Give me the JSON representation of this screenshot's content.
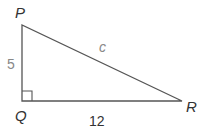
{
  "diagram": {
    "type": "right-triangle",
    "vertices": {
      "P": {
        "label": "P"
      },
      "Q": {
        "label": "Q"
      },
      "R": {
        "label": "R"
      }
    },
    "sides": {
      "PQ": {
        "label": "5"
      },
      "QR": {
        "label": "12"
      },
      "PR": {
        "label": "c"
      }
    },
    "right_angle_at": "Q",
    "colors": {
      "line": "#555555",
      "label": "#333333",
      "side_label": "#888888"
    }
  }
}
